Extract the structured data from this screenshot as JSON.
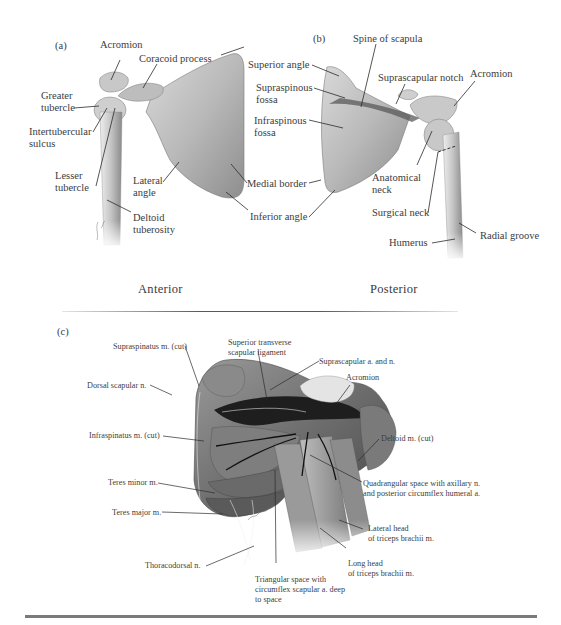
{
  "figure": {
    "panels": {
      "a": {
        "letter": "(a)",
        "view_title": "Anterior",
        "labels": {
          "acromion": "Acromion",
          "coracoid": "Coracoid process",
          "superior_angle": "Superior angle",
          "greater_tubercle_1": "Greater",
          "greater_tubercle_2": "tubercle",
          "intertubercular_1": "Intertubercular",
          "intertubercular_2": "sulcus",
          "lesser_tubercle_1": "Lesser",
          "lesser_tubercle_2": "tubercle",
          "lateral_angle_1": "Lateral",
          "lateral_angle_2": "angle",
          "medial_border": "Medial border",
          "inferior_angle": "Inferior angle",
          "deltoid_tuberosity_1": "Deltoid",
          "deltoid_tuberosity_2": "tuberosity",
          "supraspinous_fossa_1": "Supraspinous",
          "supraspinous_fossa_2": "fossa",
          "infraspinous_fossa_1": "Infraspinous",
          "infraspinous_fossa_2": "fossa"
        }
      },
      "b": {
        "letter": "(b)",
        "view_title": "Posterior",
        "labels": {
          "spine_of_scapula": "Spine of scapula",
          "suprascapular_notch": "Suprascapular notch",
          "acromion": "Acromion",
          "anatomical_neck_1": "Anatomical",
          "anatomical_neck_2": "neck",
          "surgical_neck": "Surgical neck",
          "humerus": "Humerus",
          "radial_groove": "Radial groove"
        }
      },
      "c": {
        "letter": "(c)",
        "labels": {
          "supraspinatus": "Supraspinatus m. (cut)",
          "superior_transverse_1": "Superior transverse",
          "superior_transverse_2": "scapular ligament",
          "suprascapular_an": "Suprascapular a. and n.",
          "acromion": "Acromion",
          "dorsal_scapular": "Dorsal scapular n.",
          "infraspinatus": "Infraspinatus m. (cut)",
          "deltoid_cut": "Deltoid m. (cut)",
          "quadrangular_1": "Quadrangular space with axillary n.",
          "quadrangular_2": "and posterior circumflex humeral a.",
          "teres_minor": "Teres minor m.",
          "teres_major": "Teres major m.",
          "lateral_head_1": "Lateral head",
          "lateral_head_2": "of triceps brachii m.",
          "long_head_1": "Long head",
          "long_head_2": "of triceps brachii m.",
          "thoracodorsal": "Thoracodorsal n.",
          "triangular_1": "Triangular space with",
          "triangular_2": "circumflex scapular a. deep",
          "triangular_3": "to space"
        }
      }
    }
  }
}
